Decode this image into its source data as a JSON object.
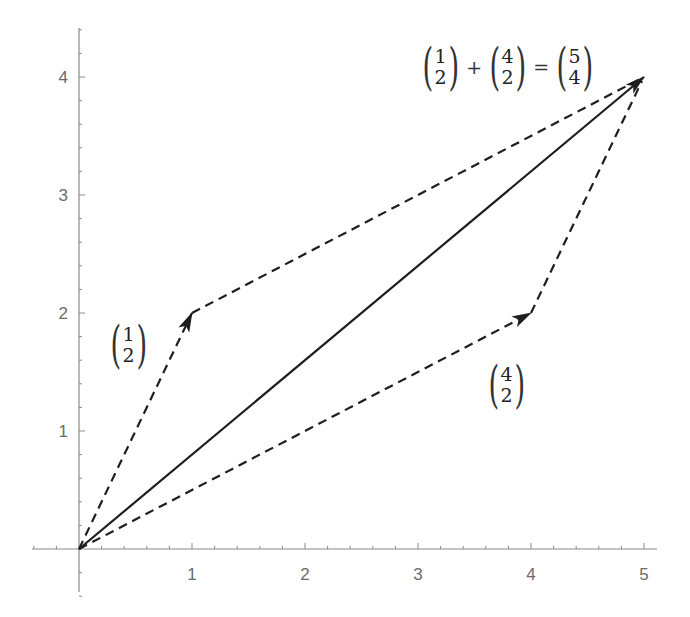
{
  "chart_data": {
    "type": "vector-diagram",
    "title": "",
    "xlabel": "",
    "ylabel": "",
    "xlim": [
      -0.4,
      5.1
    ],
    "ylim": [
      -0.4,
      4.4
    ],
    "x_ticks": [
      "1",
      "2",
      "3",
      "4",
      "5"
    ],
    "y_ticks": [
      "1",
      "2",
      "3",
      "4"
    ],
    "grid": false,
    "vectors": [
      {
        "name": "u",
        "from": [
          0,
          0
        ],
        "to": [
          1,
          2
        ],
        "style": "dashed",
        "label": "(1,2)"
      },
      {
        "name": "v",
        "from": [
          0,
          0
        ],
        "to": [
          4,
          2
        ],
        "style": "dashed",
        "label": "(4,2)"
      },
      {
        "name": "u+v",
        "from": [
          0,
          0
        ],
        "to": [
          5,
          4
        ],
        "style": "solid",
        "label": "(5,4)"
      },
      {
        "name": "v translated",
        "from": [
          1,
          2
        ],
        "to": [
          5,
          4
        ],
        "style": "dashed"
      },
      {
        "name": "u translated",
        "from": [
          4,
          2
        ],
        "to": [
          5,
          4
        ],
        "style": "dashed"
      }
    ]
  },
  "axes": {
    "x_tick_labels": [
      "1",
      "2",
      "3",
      "4",
      "5"
    ],
    "y_tick_labels": [
      "1",
      "2",
      "3",
      "4"
    ]
  },
  "labels": {
    "u": {
      "top": "1",
      "bottom": "2"
    },
    "v": {
      "top": "4",
      "bottom": "2"
    },
    "equation": {
      "a": {
        "top": "1",
        "bottom": "2"
      },
      "plus": "+",
      "b": {
        "top": "4",
        "bottom": "2"
      },
      "equals": "=",
      "c": {
        "top": "5",
        "bottom": "4"
      }
    }
  },
  "colors": {
    "axis": "#8a8a8a",
    "vector": "#1e1e1e",
    "text": "#6b6b6b"
  }
}
